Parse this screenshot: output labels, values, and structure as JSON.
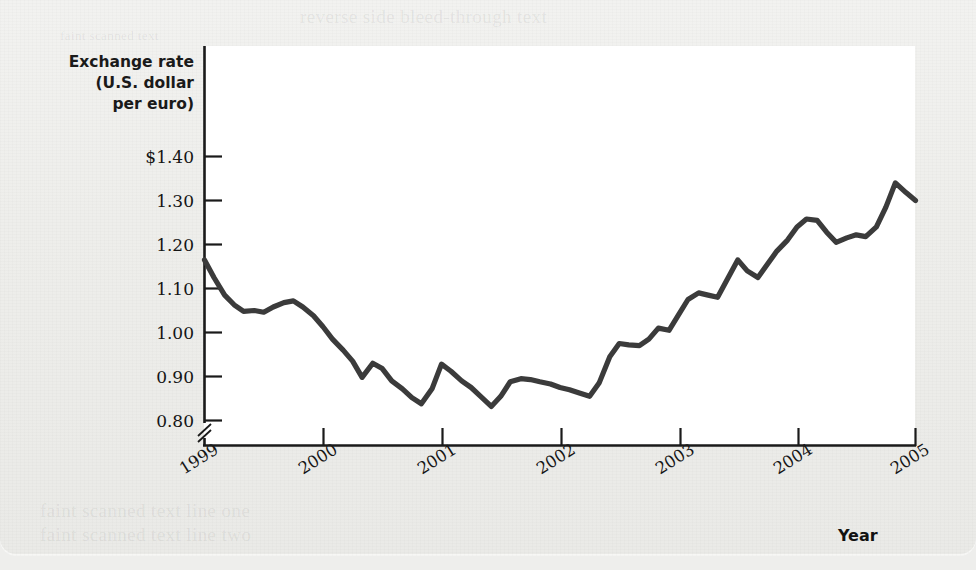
{
  "figure": {
    "y_axis_title_lines": [
      "Exchange rate",
      "(U.S. dollar",
      "per euro)"
    ],
    "x_axis_title": "Year",
    "line_color": "#3b3b3b",
    "axis_color": "#1a1a1a",
    "plot_background": "#ffffff",
    "page_background": "#eeeeeb"
  },
  "ghost_text": {
    "top": "reverse side bleed-through text",
    "top_small": "faint scanned text",
    "bottom_1": "faint scanned text line one",
    "bottom_2": "faint scanned text line two"
  },
  "chart_data": {
    "type": "line",
    "title": "",
    "subtitle": "",
    "xlabel": "Year",
    "ylabel": "Exchange rate (U.S. dollar per euro)",
    "y_tick_labels": [
      "$1.40",
      "1.30",
      "1.20",
      "1.10",
      "1.00",
      "0.90",
      "0.80"
    ],
    "y_tick_values": [
      1.4,
      1.3,
      1.2,
      1.1,
      1.0,
      0.9,
      0.8
    ],
    "x_tick_labels": [
      "1999",
      "2000",
      "2001",
      "2002",
      "2003",
      "2004",
      "2005"
    ],
    "x_tick_values": [
      1999,
      2000,
      2001,
      2002,
      2003,
      2004,
      2005
    ],
    "ylim": [
      0.8,
      1.44
    ],
    "xlim": [
      1999,
      2005
    ],
    "y_axis_break": true,
    "grid": false,
    "legend": null,
    "series": [
      {
        "name": "U.S. dollar per euro",
        "color": "#3b3b3b",
        "x": [
          1999.0,
          1999.08,
          1999.17,
          1999.25,
          1999.33,
          1999.42,
          1999.5,
          1999.58,
          1999.67,
          1999.75,
          1999.83,
          1999.92,
          2000.0,
          2000.08,
          2000.17,
          2000.25,
          2000.33,
          2000.42,
          2000.5,
          2000.58,
          2000.67,
          2000.75,
          2000.83,
          2000.92,
          2001.0,
          2001.08,
          2001.17,
          2001.25,
          2001.33,
          2001.42,
          2001.5,
          2001.58,
          2001.67,
          2001.75,
          2001.83,
          2001.92,
          2002.0,
          2002.08,
          2002.17,
          2002.25,
          2002.33,
          2002.42,
          2002.5,
          2002.58,
          2002.67,
          2002.75,
          2002.83,
          2002.92,
          2003.0,
          2003.08,
          2003.17,
          2003.25,
          2003.33,
          2003.42,
          2003.5,
          2003.58,
          2003.67,
          2003.75,
          2003.83,
          2003.92,
          2004.0,
          2004.08,
          2004.17,
          2004.25,
          2004.33,
          2004.42,
          2004.5,
          2004.58,
          2004.67,
          2004.75,
          2004.83,
          2004.92,
          2005.0
        ],
        "y": [
          1.165,
          1.125,
          1.085,
          1.063,
          1.048,
          1.05,
          1.046,
          1.058,
          1.068,
          1.072,
          1.058,
          1.038,
          1.013,
          0.985,
          0.96,
          0.935,
          0.898,
          0.93,
          0.918,
          0.89,
          0.872,
          0.852,
          0.838,
          0.872,
          0.928,
          0.912,
          0.89,
          0.875,
          0.855,
          0.832,
          0.855,
          0.888,
          0.895,
          0.893,
          0.888,
          0.883,
          0.875,
          0.87,
          0.862,
          0.855,
          0.885,
          0.945,
          0.975,
          0.972,
          0.97,
          0.985,
          1.01,
          1.005,
          1.04,
          1.075,
          1.09,
          1.085,
          1.08,
          1.125,
          1.165,
          1.14,
          1.125,
          1.155,
          1.185,
          1.21,
          1.24,
          1.258,
          1.255,
          1.228,
          1.205,
          1.215,
          1.222,
          1.218,
          1.24,
          1.285,
          1.34,
          1.318,
          1.3
        ]
      }
    ],
    "annotations": [
      {
        "text": "Axis break below 0.80 on the vertical axis"
      }
    ],
    "reading": {
      "start_1999": 1.165,
      "minimum": 0.832,
      "minimum_when": "late 2001",
      "maximum": 1.34,
      "maximum_when": "late 2004",
      "end_2005": 1.3
    }
  }
}
